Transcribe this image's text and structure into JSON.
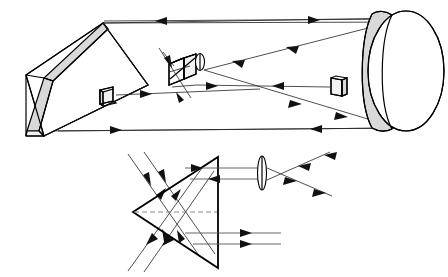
{
  "figure": {
    "background_color": "#ffffff",
    "line_color": "#000000",
    "ray_color": "#222222",
    "shade_color": "#d9d9d9",
    "dashed_axis_color": "#8a8a8a",
    "panel_count": 2
  },
  "panels": [
    {
      "id": "perspective-view",
      "label": "Three-dimensional perspective view of folded telescope optics",
      "view": "3d-perspective",
      "bounds": {
        "x": 0,
        "y": 0,
        "width": 448,
        "height": 140
      },
      "components": [
        {
          "name": "large-flat-mirror",
          "type": "flat-mirror-plate",
          "shape": "parallelogram-slab",
          "face_color": "#f2f2f2",
          "edge_color": "#d9d9d9",
          "position": {
            "x": 18,
            "y": 15,
            "width": 130,
            "height": 125
          },
          "role": "primary folding flat"
        },
        {
          "name": "beamsplitter-cube",
          "type": "beam-splitter-cube",
          "shape": "cube",
          "face_color": "#ffffff",
          "position": {
            "x": 168,
            "y": 55,
            "width": 30,
            "height": 30
          },
          "role": "splits and recombines beams"
        },
        {
          "name": "collimating-lens",
          "type": "lens",
          "shape": "biconvex",
          "position": {
            "x": 199,
            "y": 62,
            "width": 8,
            "height": 18
          },
          "role": "collimator"
        },
        {
          "name": "fold-mirror-left",
          "type": "small-flat-mirror",
          "shape": "square-plate",
          "face_color": "#f2f2f2",
          "position": {
            "x": 99,
            "y": 88,
            "width": 14,
            "height": 16
          },
          "role": "reference arm fold mirror"
        },
        {
          "name": "fold-mirror-right",
          "type": "small-flat-mirror",
          "shape": "square-plate",
          "face_color": "#f2f2f2",
          "position": {
            "x": 328,
            "y": 78,
            "width": 14,
            "height": 18
          },
          "role": "measurement arm fold mirror"
        },
        {
          "name": "large-circular-mirror",
          "type": "circular-mirror",
          "shape": "ellipse-perspective",
          "face_color": "#ffffff",
          "rim_color": "#d9d9d9",
          "position": {
            "x": 362,
            "y": 8,
            "width": 82,
            "height": 124
          },
          "role": "large aperture collector"
        }
      ],
      "rays": [
        {
          "name": "ray-top-edge",
          "direction": "bidirectional",
          "arrow_count": 2,
          "path": "horizontal top chord"
        },
        {
          "name": "ray-bottom-edge",
          "direction": "bidirectional",
          "arrow_count": 2,
          "path": "horizontal bottom chord"
        },
        {
          "name": "ray-upper-converging",
          "direction": "leftward",
          "arrow_count": 2,
          "path": "mirror rim to cube"
        },
        {
          "name": "ray-lower-converging",
          "direction": "leftward",
          "arrow_count": 2,
          "path": "mirror rim to cube"
        },
        {
          "name": "ray-reference-arm",
          "direction": "rightward",
          "arrow_count": 1,
          "path": "fold mirror left to cube"
        },
        {
          "name": "ray-measurement-arm",
          "direction": "leftward",
          "arrow_count": 1,
          "path": "fold mirror right to cube"
        },
        {
          "name": "ray-input-diagonal",
          "direction": "into-cube",
          "arrow_count": 2,
          "path": "diagonal through cube"
        }
      ]
    },
    {
      "id": "prism-ray-trace",
      "label": "Two-dimensional ray trace through right-angle prism and lens",
      "view": "2d-section",
      "bounds": {
        "x": 80,
        "y": 140,
        "width": 368,
        "height": 137
      },
      "components": [
        {
          "name": "triangular-prism",
          "type": "prism",
          "shape": "isoceles-triangle",
          "apex": {
            "x": 133,
            "y": 212
          },
          "top_vertex": {
            "x": 218,
            "y": 157
          },
          "bottom_vertex": {
            "x": 218,
            "y": 268
          },
          "face_color": "#ffffff",
          "role": "retroreflecting prism"
        },
        {
          "name": "optical-axis",
          "type": "dashed-axis",
          "style": "dashed",
          "from": {
            "x": 133,
            "y": 212
          },
          "to": {
            "x": 218,
            "y": 212
          },
          "color": "#8a8a8a"
        },
        {
          "name": "focusing-lens",
          "type": "lens",
          "shape": "biconvex",
          "position": {
            "x": 261,
            "y": 183
          },
          "width": 9,
          "height": 36,
          "role": "focuses exit beams to a crossover"
        }
      ],
      "rays": [
        {
          "name": "ray-in-upper-1",
          "direction": "down-right",
          "arrow_count": 1,
          "entry": "upper left face"
        },
        {
          "name": "ray-in-upper-2",
          "direction": "down-right",
          "arrow_count": 1,
          "entry": "upper left face"
        },
        {
          "name": "ray-out-lower-1",
          "direction": "down-left",
          "arrow_count": 1,
          "exit": "lower left face"
        },
        {
          "name": "ray-out-lower-2",
          "direction": "down-left",
          "arrow_count": 1,
          "exit": "lower left face"
        },
        {
          "name": "ray-internal-up-1",
          "direction": "up-right",
          "arrow_count": 1,
          "path": "internal reflection"
        },
        {
          "name": "ray-internal-up-2",
          "direction": "up-right",
          "arrow_count": 1,
          "path": "internal reflection"
        },
        {
          "name": "ray-internal-down-1",
          "direction": "down-right",
          "arrow_count": 1,
          "path": "internal reflection"
        },
        {
          "name": "ray-internal-down-2",
          "direction": "down-right",
          "arrow_count": 1,
          "path": "internal reflection"
        },
        {
          "name": "ray-exit-top-right",
          "direction": "rightward",
          "arrow_count": 1,
          "path": "to lens"
        },
        {
          "name": "ray-exit-top-left",
          "direction": "leftward",
          "arrow_count": 1,
          "path": "from lens"
        },
        {
          "name": "ray-exit-bottom-1",
          "direction": "rightward",
          "arrow_count": 1,
          "path": "lower parallel pair"
        },
        {
          "name": "ray-exit-bottom-2",
          "direction": "rightward",
          "arrow_count": 1,
          "path": "lower parallel pair"
        },
        {
          "name": "ray-focus-up-right",
          "direction": "up-right",
          "arrow_count": 2,
          "path": "after lens crossover"
        },
        {
          "name": "ray-focus-down-right",
          "direction": "down-right",
          "arrow_count": 2,
          "path": "after lens crossover"
        }
      ]
    }
  ]
}
